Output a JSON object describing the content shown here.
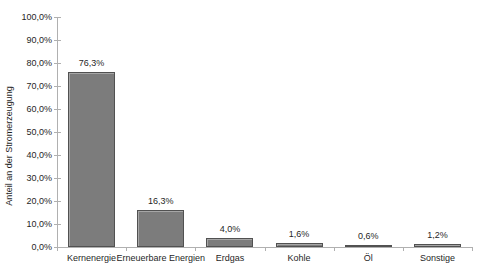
{
  "chart_data": {
    "type": "bar",
    "categories": [
      "Kernenergie",
      "Erneuerbare Energien",
      "Erdgas",
      "Kohle",
      "Öl",
      "Sonstige"
    ],
    "values": [
      76.3,
      16.3,
      4.0,
      1.6,
      0.6,
      1.2
    ],
    "value_labels": [
      "76,3%",
      "16,3%",
      "4,0%",
      "1,6%",
      "0,6%",
      "1,2%"
    ],
    "xlabel": "",
    "ylabel": "Anteil an der Stromerzeugung",
    "ylim": [
      0,
      100
    ],
    "y_tick_step": 10,
    "y_tick_labels": [
      "0,0%",
      "10,0%",
      "20,0%",
      "30,0%",
      "40,0%",
      "50,0%",
      "60,0%",
      "70,0%",
      "80,0%",
      "90,0%",
      "100,0%"
    ],
    "grid": false,
    "legend": false,
    "colors": {
      "bar_fill": "#7c7c7c",
      "bar_border": "#515151",
      "bar_highlight": "#a8a8a8",
      "axis": "#b0b0b0",
      "text": "#1f1f1f",
      "background": "#ffffff"
    }
  }
}
